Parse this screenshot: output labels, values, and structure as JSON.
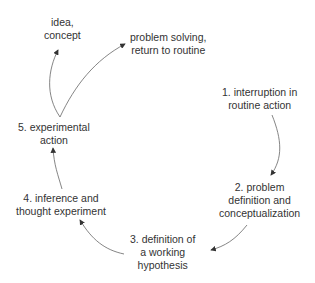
{
  "diagram": {
    "type": "cycle",
    "nodes": [
      {
        "id": "idea",
        "label_lines": [
          "idea,",
          "concept"
        ]
      },
      {
        "id": "solve",
        "label_lines": [
          "problem solving,",
          "return to routine"
        ]
      },
      {
        "id": "n1",
        "label_lines": [
          "1. interruption in",
          "routine action"
        ]
      },
      {
        "id": "n2",
        "label_lines": [
          "2. problem",
          "definition and",
          "conceptualization"
        ]
      },
      {
        "id": "n3",
        "label_lines": [
          "3. definition of",
          "a working",
          "hypothesis"
        ]
      },
      {
        "id": "n4",
        "label_lines": [
          "4. inference and",
          "thought experiment"
        ]
      },
      {
        "id": "n5",
        "label_lines": [
          "5. experimental",
          "action"
        ]
      }
    ],
    "edges": [
      {
        "from": "n1",
        "to": "n2"
      },
      {
        "from": "n2",
        "to": "n3"
      },
      {
        "from": "n3",
        "to": "n4"
      },
      {
        "from": "n4",
        "to": "n5"
      },
      {
        "from": "n5",
        "to": "idea"
      },
      {
        "from": "n5",
        "to": "solve"
      }
    ],
    "colors": {
      "line": "#555555",
      "text": "#333333",
      "background": "#ffffff"
    }
  }
}
